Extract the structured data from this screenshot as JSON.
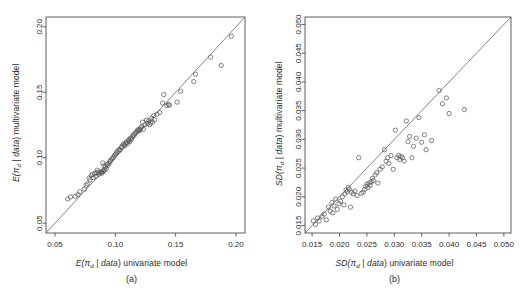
{
  "figure": {
    "type": "scatter-panel-figure",
    "panels": [
      "a",
      "b"
    ],
    "marker": "open-circle",
    "reference_line": "identity (y = x)"
  },
  "panel_a": {
    "caption": "(a)",
    "xlabel_prefix": "E(",
    "xlabel_symbol": "π",
    "xlabel_subscript": "d",
    "xlabel_mid": " | ",
    "xlabel_data": "data",
    "xlabel_suffix": ") univariate model",
    "ylabel_suffix": ") multivariate model",
    "xlabel_full": "E(πd | data) univariate model",
    "ylabel_full": "E(πd | data) multivariate model",
    "xticks": [
      "0.05",
      "0.10",
      "0.15",
      "0.20"
    ],
    "yticks": [
      "0.05",
      "0.10",
      "0.15",
      "0.20"
    ]
  },
  "panel_b": {
    "caption": "(b)",
    "xlabel_prefix": "SD(",
    "xlabel_symbol": "π",
    "xlabel_subscript": "d",
    "xlabel_mid": " | ",
    "xlabel_data": "data",
    "xlabel_suffix": ") univariate model",
    "ylabel_suffix": ") multivariate model",
    "xlabel_full": "SD(πd | data) univariate model",
    "ylabel_full": "SD(πd | data) multivariate model",
    "xticks": [
      "0.015",
      "0.020",
      "0.025",
      "0.030",
      "0.035",
      "0.040",
      "0.045",
      "0.050"
    ],
    "yticks": [
      "0.015",
      "0.020",
      "0.025",
      "0.030",
      "0.035",
      "0.040",
      "0.045",
      "0.050"
    ]
  },
  "colors": {
    "marker_stroke": "#5a5a5a",
    "axis": "#4d4d4d",
    "line": "#666666",
    "text": "#2b2b2b",
    "background": "#ffffff"
  },
  "chart_data": [
    {
      "type": "scatter",
      "panel": "a",
      "title": "",
      "xlabel": "E(πd | data) univariate model",
      "ylabel": "E(πd | data) multivariate model",
      "xlim": [
        0.0425,
        0.2075
      ],
      "ylim": [
        0.0425,
        0.2075
      ],
      "xticks": [
        0.05,
        0.1,
        0.15,
        0.2
      ],
      "yticks": [
        0.05,
        0.1,
        0.15,
        0.2
      ],
      "grid": false,
      "legend": "none",
      "reference_line": {
        "type": "identity",
        "slope": 1,
        "intercept": 0
      },
      "points": [
        [
          0.0605,
          0.0685
        ],
        [
          0.0628,
          0.07
        ],
        [
          0.0668,
          0.0705
        ],
        [
          0.069,
          0.0718
        ],
        [
          0.0705,
          0.074
        ],
        [
          0.0742,
          0.076
        ],
        [
          0.0758,
          0.079
        ],
        [
          0.0768,
          0.08
        ],
        [
          0.0782,
          0.0845
        ],
        [
          0.079,
          0.083
        ],
        [
          0.08,
          0.0865
        ],
        [
          0.0812,
          0.0872
        ],
        [
          0.0818,
          0.0848
        ],
        [
          0.0828,
          0.088
        ],
        [
          0.0838,
          0.0858
        ],
        [
          0.0845,
          0.0885
        ],
        [
          0.085,
          0.0905
        ],
        [
          0.0858,
          0.089
        ],
        [
          0.0862,
          0.0872
        ],
        [
          0.0872,
          0.0885
        ],
        [
          0.088,
          0.0888
        ],
        [
          0.0885,
          0.0892
        ],
        [
          0.089,
          0.0882
        ],
        [
          0.0895,
          0.096
        ],
        [
          0.0898,
          0.09
        ],
        [
          0.0902,
          0.0895
        ],
        [
          0.0905,
          0.0938
        ],
        [
          0.0912,
          0.0908
        ],
        [
          0.0918,
          0.093
        ],
        [
          0.0925,
          0.0918
        ],
        [
          0.093,
          0.095
        ],
        [
          0.0938,
          0.0942
        ],
        [
          0.0948,
          0.0958
        ],
        [
          0.0955,
          0.0972
        ],
        [
          0.0962,
          0.098
        ],
        [
          0.0972,
          0.0992
        ],
        [
          0.0982,
          0.1
        ],
        [
          0.099,
          0.1012
        ],
        [
          0.0998,
          0.1022
        ],
        [
          0.1005,
          0.103
        ],
        [
          0.1012,
          0.1042
        ],
        [
          0.1022,
          0.105
        ],
        [
          0.103,
          0.1062
        ],
        [
          0.1038,
          0.1058
        ],
        [
          0.1048,
          0.1078
        ],
        [
          0.1055,
          0.1085
        ],
        [
          0.1062,
          0.1098
        ],
        [
          0.107,
          0.1105
        ],
        [
          0.1078,
          0.1092
        ],
        [
          0.1085,
          0.1112
        ],
        [
          0.1092,
          0.112
        ],
        [
          0.11,
          0.1108
        ],
        [
          0.1108,
          0.1128
        ],
        [
          0.1112,
          0.114
        ],
        [
          0.1118,
          0.1122
        ],
        [
          0.1125,
          0.1148
        ],
        [
          0.1132,
          0.1138
        ],
        [
          0.114,
          0.1158
        ],
        [
          0.1148,
          0.1175
        ],
        [
          0.1155,
          0.1168
        ],
        [
          0.1162,
          0.1185
        ],
        [
          0.1172,
          0.1192
        ],
        [
          0.1178,
          0.1202
        ],
        [
          0.1185,
          0.1212
        ],
        [
          0.1192,
          0.1205
        ],
        [
          0.1198,
          0.1218
        ],
        [
          0.1205,
          0.121
        ],
        [
          0.1212,
          0.1228
        ],
        [
          0.1218,
          0.1238
        ],
        [
          0.1225,
          0.1272
        ],
        [
          0.1232,
          0.1218
        ],
        [
          0.1245,
          0.1252
        ],
        [
          0.1258,
          0.1288
        ],
        [
          0.1268,
          0.1262
        ],
        [
          0.1278,
          0.1282
        ],
        [
          0.1285,
          0.1252
        ],
        [
          0.1292,
          0.1265
        ],
        [
          0.13,
          0.1302
        ],
        [
          0.1308,
          0.1272
        ],
        [
          0.1318,
          0.1322
        ],
        [
          0.1325,
          0.129
        ],
        [
          0.1345,
          0.1332
        ],
        [
          0.1368,
          0.1345
        ],
        [
          0.1392,
          0.1418
        ],
        [
          0.1402,
          0.1482
        ],
        [
          0.1428,
          0.1398
        ],
        [
          0.144,
          0.1408
        ],
        [
          0.1448,
          0.1402
        ],
        [
          0.1512,
          0.1425
        ],
        [
          0.1542,
          0.1508
        ],
        [
          0.165,
          0.1582
        ],
        [
          0.1665,
          0.1638
        ],
        [
          0.179,
          0.1768
        ],
        [
          0.1878,
          0.1705
        ],
        [
          0.1962,
          0.1928
        ]
      ]
    },
    {
      "type": "scatter",
      "panel": "b",
      "title": "",
      "xlabel": "SD(πd | data) univariate model",
      "ylabel": "SD(πd | data) multivariate model",
      "xlim": [
        0.0137,
        0.0513
      ],
      "ylim": [
        0.0137,
        0.0513
      ],
      "xticks": [
        0.015,
        0.02,
        0.025,
        0.03,
        0.035,
        0.04,
        0.045,
        0.05
      ],
      "yticks": [
        0.015,
        0.02,
        0.025,
        0.03,
        0.035,
        0.04,
        0.045,
        0.05
      ],
      "grid": false,
      "legend": "none",
      "reference_line": {
        "type": "identity",
        "slope": 1,
        "intercept": 0
      },
      "points": [
        [
          0.0152,
          0.0158
        ],
        [
          0.0156,
          0.0152
        ],
        [
          0.016,
          0.0163
        ],
        [
          0.0163,
          0.0158
        ],
        [
          0.0168,
          0.0166
        ],
        [
          0.0172,
          0.017
        ],
        [
          0.0176,
          0.016
        ],
        [
          0.018,
          0.0182
        ],
        [
          0.0183,
          0.0175
        ],
        [
          0.0186,
          0.019
        ],
        [
          0.0188,
          0.0172
        ],
        [
          0.019,
          0.0184
        ],
        [
          0.0193,
          0.0196
        ],
        [
          0.0196,
          0.0178
        ],
        [
          0.0199,
          0.0188
        ],
        [
          0.0202,
          0.0192
        ],
        [
          0.0205,
          0.02
        ],
        [
          0.0208,
          0.0186
        ],
        [
          0.021,
          0.0205
        ],
        [
          0.0212,
          0.0212
        ],
        [
          0.0214,
          0.0209
        ],
        [
          0.0216,
          0.0216
        ],
        [
          0.0218,
          0.0213
        ],
        [
          0.022,
          0.0182
        ],
        [
          0.0222,
          0.0208
        ],
        [
          0.0225,
          0.0205
        ],
        [
          0.0228,
          0.021
        ],
        [
          0.0232,
          0.0202
        ],
        [
          0.0235,
          0.0268
        ],
        [
          0.024,
          0.0206
        ],
        [
          0.0243,
          0.0208
        ],
        [
          0.0246,
          0.0213
        ],
        [
          0.0248,
          0.0218
        ],
        [
          0.025,
          0.0222
        ],
        [
          0.0252,
          0.0216
        ],
        [
          0.0254,
          0.0224
        ],
        [
          0.0256,
          0.022
        ],
        [
          0.0258,
          0.0226
        ],
        [
          0.026,
          0.0232
        ],
        [
          0.0262,
          0.0228
        ],
        [
          0.0265,
          0.0238
        ],
        [
          0.0268,
          0.0242
        ],
        [
          0.027,
          0.0224
        ],
        [
          0.0274,
          0.0248
        ],
        [
          0.0278,
          0.0252
        ],
        [
          0.0282,
          0.0282
        ],
        [
          0.0285,
          0.0262
        ],
        [
          0.0288,
          0.0268
        ],
        [
          0.029,
          0.0258
        ],
        [
          0.0294,
          0.0272
        ],
        [
          0.0298,
          0.0248
        ],
        [
          0.0302,
          0.0316
        ],
        [
          0.0305,
          0.0268
        ],
        [
          0.0308,
          0.0272
        ],
        [
          0.031,
          0.0265
        ],
        [
          0.0312,
          0.027
        ],
        [
          0.0315,
          0.0268
        ],
        [
          0.0318,
          0.0262
        ],
        [
          0.0322,
          0.0332
        ],
        [
          0.0325,
          0.0296
        ],
        [
          0.0328,
          0.0305
        ],
        [
          0.0332,
          0.0268
        ],
        [
          0.0335,
          0.0288
        ],
        [
          0.034,
          0.0302
        ],
        [
          0.0345,
          0.0338
        ],
        [
          0.035,
          0.0295
        ],
        [
          0.0355,
          0.0308
        ],
        [
          0.0358,
          0.0282
        ],
        [
          0.0368,
          0.0298
        ],
        [
          0.0382,
          0.0385
        ],
        [
          0.0388,
          0.0362
        ],
        [
          0.0395,
          0.0372
        ],
        [
          0.04,
          0.0345
        ],
        [
          0.0428,
          0.0352
        ]
      ]
    }
  ]
}
